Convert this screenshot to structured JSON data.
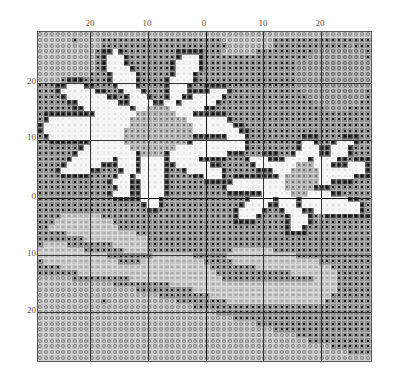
{
  "chart_data": {
    "type": "heatmap",
    "title": "",
    "grid": {
      "cols": 58,
      "rows": 58
    },
    "x_ticks": [
      {
        "label": "20",
        "px": 90
      },
      {
        "label": "10",
        "px": 147
      },
      {
        "label": "0",
        "px": 204
      },
      {
        "label": "10",
        "px": 263
      },
      {
        "label": "20",
        "px": 320
      }
    ],
    "y_ticks": [
      {
        "label": "20",
        "px": 81
      },
      {
        "label": "10",
        "px": 137
      },
      {
        "label": "0",
        "px": 196
      },
      {
        "label": "10",
        "px": 253
      },
      {
        "label": "20",
        "px": 310
      }
    ],
    "legend": {
      "d": "dark background (black square)",
      "l": "light gray (circle)",
      "m": "medium gray (circle)",
      "w": "white petal",
      "o": "dark outline",
      "c": "flower center gray",
      "s": "swirl light gray"
    },
    "rows": [
      "llllllllllllllllllllllllllllllllllllllllllllllllllllllllll",
      "lllllldlllldddddddddddddddddddddlllllllllddddddddddddddddd",
      "lllllllllllddddddddddddddddddddddlllllllldddddddddddddmddd",
      "lllllllllldoowodddddddddooooodddllllllddddddddddmmmmmmmmmd",
      "lllllllllldowwwoddddddddowwwoddddddddddddddddddmmmmmmmmmmd",
      "lllllllllldowwwodddddddowwwwoddddddddddddddddmmmmmmmmmmmmm",
      "lllllllllldowwwwoddddddowwwwoddddddddddddddddmmmmmmmmmmmmm",
      "llllllllldddowwwwodddddowwwodddddddddddddddddmmmmmmmmmmmmm",
      "lllldoooddddowwwwoddddowwwwodddddddddddddddddmmmmmmmmmmmmm",
      "dddoowwwoodddowwwoddddowwwoddooooddddddddddddmmmmmmmmmmmmm",
      "dddowwwwwwooddowwwodddowwwoooowwwoddddddddddddmmmmmmmmmmmd",
      "ddddowwwwwwwoodowwwoddowwoowwwwwoddddddddddddddmmmmmmmmmmd",
      "dddddoowwwwwwwoowwwwoowwowwwwwwoddddddddddddddddmmmmmmmmdd",
      "ddddddoowwwwwwwwowwccccwwwwwwoodddddddddddddddddddmmmmdddd",
      "dooooooooowwwwwwwcccccccwwwoooooodddddddddddddddddddddddddd",
      "dowwwwwwwwwwwwwwccccccccccwwwwwwwoddddddddddddddddddddddddd",
      "owwwwwwwwwwwwwwwcccccccccccwwwwwwwooddddddddddddddddddddddd",
      "owwwwwwwwwwwwwwccccccccccccwwwwwwwwoodddddddddddddddddddddd",
      "dowwwwwwwwwwwwwccccccccccccoooooowwwodddddddddoooddddoooddd",
      "ddooooooowwwwwwcccccccccccowwwwwwwwwoddddddddowwoddowwwoddd",
      "dddddddowwwwwwwwccccccccwwwwwwwwwwwwoddddddddowwwoowwwodddd",
      "ddddddowwwwwwwwwwoccccowwwwwwwwwwooodddoooddowwwwoowwwodddd",
      "dddddowwwwwwwowwwowwwwowwwwwooooodddowwwooowwwwowwwwoodoood",
      "ddddowwwwwwooowwwowwwwoowwwwwwoodddddowwwwwwwcccwwwooowwwod",
      "dddowwwwwoodddowwowwwwoddowwwwwwodddddooowwwcccccwwwwwwwwod",
      "ddddoooooddddowwowwwwwoddddoowwwodoooooooowccccccwwwwwwooodd",
      "ddddddddddddowwwoowwwwoddddddooooowwwwwwwwwccccccwwooooddddd",
      "dddddddddddddowwoowwwwodddddddddowwwwwwwwwwcccccooodddddddddd",
      "ddddddddddddowwwoowwwwoddddddddddoooooowwwwwcccwwwwoodddddddd",
      "dddddddddddddooooowwwoddddddddddddddowwwwowwwowwwwwwwwoodddd",
      "ddddddddddddddddddowwodddddddddddddowwwwoowwwowwwwwwwwwwoddd",
      "dddddddddddddddddddoodddddddddddddowwwwoddowwwoowwwwwwwwoddd",
      "ddddsssssssdddddddddddddddddddddddowwwoddddowwwoddoooooooodd",
      "dddssssssssssdddddddddddddddddddddoooodddddowwwoddddddddddd",
      "ddssssssssssssdddddddddddddddddddddddddddddowwoddddddddddddd",
      "dddddssssssssssssddddddddddddddddddddddddddooooddddddddddddd",
      "ddddddddsssssssssssddddddddddddddddddddddddddddddddddddddddd",
      "dssssddddddddssssssddddddddddddddddddddddddddddddddddddddddd",
      "ssssssssdddddddssssdddddddddddddddsssssssddddddddddddddddddd",
      "ssssssssssssddddddddsssssssddddddssssssssssssddddddddddddddd",
      "dsssssssssssssddddsssssssssssdddddsssssssssssssssddddddddddd",
      "ddddssssssssssssssssssssssssssddddddddsssssssssssssdddddddddd",
      "dddddddssssssssssssssssssssssssdddddddddddddssssssssdddddddd",
      "llllllddddddddddssssssssssssssssddddddddddddddddssssdddddddd",
      "lllllllllllllddddddddddsssssssssssssssssssssssssssssdddddddd",
      "lllllllllllllllllddddddddddsssssssssssssssssssssssssdddddddd",
      "llllllllllllllllllllldddddddddsssssssssssssssssssssddddddddd",
      "llllllllllldlllllllllllldddddddddsssssssssssssssssdddddddddd",
      "lllllllllllllllllllllllllllddddddddddddddddddddddddddddddddd",
      "llllllllllllllllllllllllllllllldddddddddddddddddddddddddddd",
      "lllllllllllllllllllllllllllllllllldddddddddddddddddddddddd",
      "llllllllllllllllllllllllllllllllllllllddddddddddddddddddddd",
      "lllllllllllllllllllllllllllllllllllllllllddddddddddddddddd",
      "llllllllllllllllllllllllllllllllllllllllllllldddddddddddddd",
      "lllllllllllllllllllllllllllllllllllllllllllllllddddddddddd",
      "llllllllllllllllllllllllllllllllllllllllllllllllllldddddddd",
      "lllllllllllllllllllllllllllllllllllllllllllllllllllllldddd",
      "llllllllllllllllllllllllllllllllllllllllllllllllllllllllll"
    ]
  }
}
